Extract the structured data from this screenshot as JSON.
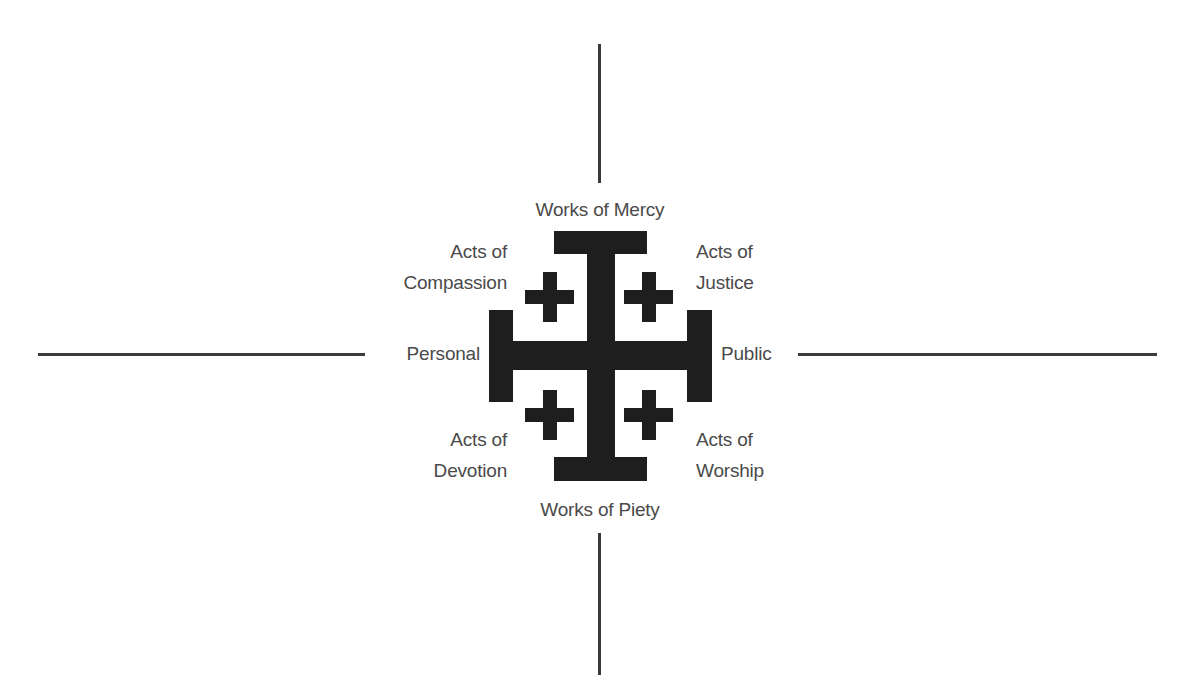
{
  "diagram": {
    "type": "jerusalem-cross quadrant diagram",
    "colors": {
      "cross": "#1e1e1e",
      "axis_lines": "#3a3a3a",
      "text": "#4a4a4a",
      "background": "#ffffff"
    },
    "axes": {
      "top": "Works of Mercy",
      "bottom": "Works of Piety",
      "left": "Personal",
      "right": "Public"
    },
    "quadrants": {
      "top_left": {
        "line1": "Acts of",
        "line2": "Compassion"
      },
      "top_right": {
        "line1": "Acts of",
        "line2": "Justice"
      },
      "bottom_left": {
        "line1": "Acts of",
        "line2": "Devotion"
      },
      "bottom_right": {
        "line1": "Acts of",
        "line2": "Worship"
      }
    },
    "center_icon": "jerusalem-cross-icon"
  }
}
